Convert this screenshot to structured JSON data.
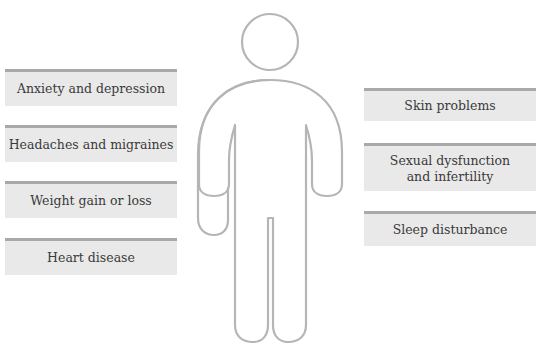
{
  "diagram": {
    "figure": {
      "icon": "human-body-outline-icon",
      "stroke_color": "#b5b5b5"
    },
    "box_color": "#e9e9e9",
    "box_border_color": "#a9a9a9",
    "left_labels": [
      "Anxiety and depression",
      "Headaches and migraines",
      "Weight gain or loss",
      "Heart disease"
    ],
    "right_labels": [
      "Skin problems",
      "Sexual dysfunction\nand infertility",
      "Sleep disturbance"
    ]
  }
}
